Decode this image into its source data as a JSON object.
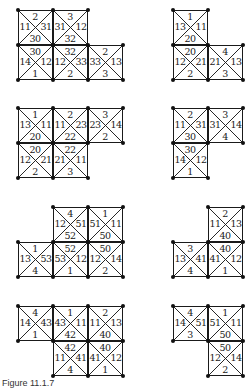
{
  "figure": {
    "caption": "Figure 11.1.7",
    "cell_size": 35,
    "pieces": [
      {
        "id": "p1",
        "x": 18,
        "y": 10,
        "cells": [
          {
            "c": 0,
            "r": 0,
            "top": "2",
            "left": "11",
            "right": "31",
            "bottom": "30"
          },
          {
            "c": 1,
            "r": 0,
            "top": "3",
            "left": "31",
            "right": "12",
            "bottom": "32"
          },
          {
            "c": 0,
            "r": 1,
            "top": "30",
            "left": "14",
            "right": "12",
            "bottom": "1"
          },
          {
            "c": 1,
            "r": 1,
            "top": "32",
            "left": "12",
            "right": "33",
            "bottom": "2"
          },
          {
            "c": 2,
            "r": 1,
            "top": "2",
            "left": "33",
            "right": "13",
            "bottom": "3"
          }
        ]
      },
      {
        "id": "p2",
        "x": 173,
        "y": 10,
        "cells": [
          {
            "c": 0,
            "r": 0,
            "top": "1",
            "left": "13",
            "right": "11",
            "bottom": "20"
          },
          {
            "c": 0,
            "r": 1,
            "top": "20",
            "left": "12",
            "right": "21",
            "bottom": "2"
          },
          {
            "c": 1,
            "r": 1,
            "top": "4",
            "left": "21",
            "right": "13",
            "bottom": "3"
          }
        ]
      },
      {
        "id": "p3",
        "x": 18,
        "y": 108,
        "cells": [
          {
            "c": 0,
            "r": 0,
            "top": "1",
            "left": "13",
            "right": "11",
            "bottom": "20"
          },
          {
            "c": 1,
            "r": 0,
            "top": "2",
            "left": "11",
            "right": "23",
            "bottom": "22"
          },
          {
            "c": 2,
            "r": 0,
            "top": "3",
            "left": "23",
            "right": "14",
            "bottom": "2"
          },
          {
            "c": 0,
            "r": 1,
            "top": "20",
            "left": "12",
            "right": "21",
            "bottom": "2"
          },
          {
            "c": 1,
            "r": 1,
            "top": "22",
            "left": "21",
            "right": "11",
            "bottom": "3"
          }
        ]
      },
      {
        "id": "p4",
        "x": 173,
        "y": 108,
        "cells": [
          {
            "c": 0,
            "r": 0,
            "top": "2",
            "left": "11",
            "right": "31",
            "bottom": "30"
          },
          {
            "c": 1,
            "r": 0,
            "top": "3",
            "left": "31",
            "right": "14",
            "bottom": "4"
          },
          {
            "c": 0,
            "r": 1,
            "top": "30",
            "left": "14",
            "right": "12",
            "bottom": "1"
          }
        ]
      },
      {
        "id": "p5",
        "x": 18,
        "y": 207,
        "cells": [
          {
            "c": 1,
            "r": 0,
            "top": "4",
            "left": "12",
            "right": "51",
            "bottom": "52"
          },
          {
            "c": 2,
            "r": 0,
            "top": "1",
            "left": "51",
            "right": "11",
            "bottom": "50"
          },
          {
            "c": 0,
            "r": 1,
            "top": "1",
            "left": "13",
            "right": "53",
            "bottom": "4"
          },
          {
            "c": 1,
            "r": 1,
            "top": "52",
            "left": "53",
            "right": "12",
            "bottom": "1"
          },
          {
            "c": 2,
            "r": 1,
            "top": "50",
            "left": "12",
            "right": "14",
            "bottom": "2"
          }
        ]
      },
      {
        "id": "p6",
        "x": 173,
        "y": 207,
        "cells": [
          {
            "c": 1,
            "r": 0,
            "top": "2",
            "left": "11",
            "right": "13",
            "bottom": "40"
          },
          {
            "c": 0,
            "r": 1,
            "top": "3",
            "left": "13",
            "right": "41",
            "bottom": "4"
          },
          {
            "c": 1,
            "r": 1,
            "top": "40",
            "left": "41",
            "right": "12",
            "bottom": "1"
          }
        ]
      },
      {
        "id": "p7",
        "x": 18,
        "y": 306,
        "cells": [
          {
            "c": 0,
            "r": 0,
            "top": "4",
            "left": "14",
            "right": "43",
            "bottom": "1"
          },
          {
            "c": 1,
            "r": 0,
            "top": "1",
            "left": "43",
            "right": "11",
            "bottom": "42"
          },
          {
            "c": 2,
            "r": 0,
            "top": "2",
            "left": "11",
            "right": "13",
            "bottom": "40"
          },
          {
            "c": 1,
            "r": 1,
            "top": "42",
            "left": "11",
            "right": "41",
            "bottom": "4"
          },
          {
            "c": 2,
            "r": 1,
            "top": "40",
            "left": "41",
            "right": "12",
            "bottom": "1"
          }
        ]
      },
      {
        "id": "p8",
        "x": 173,
        "y": 306,
        "cells": [
          {
            "c": 0,
            "r": 0,
            "top": "4",
            "left": "14",
            "right": "51",
            "bottom": "3"
          },
          {
            "c": 1,
            "r": 0,
            "top": "1",
            "left": "51",
            "right": "11",
            "bottom": "50"
          },
          {
            "c": 1,
            "r": 1,
            "top": "50",
            "left": "12",
            "right": "14",
            "bottom": "2"
          }
        ]
      }
    ]
  }
}
